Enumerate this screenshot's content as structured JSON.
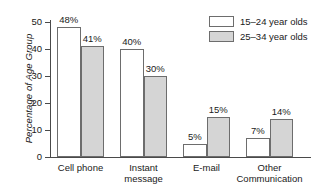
{
  "chart_data": {
    "type": "bar",
    "title": "",
    "xlabel": "",
    "ylabel": "Percentage of Age Group",
    "ylim": [
      0,
      50
    ],
    "yticks": [
      "0",
      "10",
      "20",
      "30",
      "40",
      "50"
    ],
    "grid": false,
    "legend_position": "top-right",
    "categories": [
      "Cell phone",
      "Instant message",
      "E-mail",
      "Other Communication"
    ],
    "category_lines": [
      [
        "Cell phone"
      ],
      [
        "Instant",
        "message"
      ],
      [
        "E-mail"
      ],
      [
        "Other",
        "Communication"
      ]
    ],
    "series": [
      {
        "name": "15–24 year olds",
        "color": "#ffffff",
        "values": [
          48,
          40,
          5,
          7
        ],
        "labels": [
          "48%",
          "40%",
          "5%",
          "7%"
        ]
      },
      {
        "name": "25–34 year olds",
        "color": "#d5d5d5",
        "values": [
          41,
          30,
          15,
          14
        ],
        "labels": [
          "41%",
          "30%",
          "15%",
          "14%"
        ]
      }
    ]
  },
  "legend": {
    "entries": [
      {
        "label": "15–24 year olds",
        "swatch": "light"
      },
      {
        "label": "25–34 year olds",
        "swatch": "dark"
      }
    ]
  },
  "colors": {
    "series_light": "#ffffff",
    "series_dark": "#d5d5d5",
    "axis": "#4a4a4a",
    "bar_outline": "#6d6d6d",
    "text": "#1a1a1a",
    "background": "#ffffff"
  }
}
